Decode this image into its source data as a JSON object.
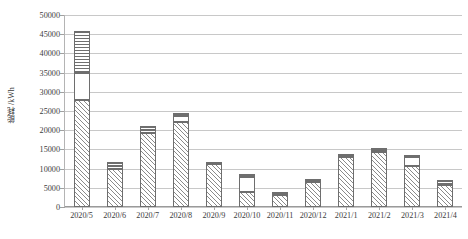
{
  "chart_data": {
    "type": "bar",
    "subtype": "stacked-bar",
    "title": "",
    "xlabel": "",
    "ylabel": "能耗 /kWh",
    "ylim": [
      0,
      50000
    ],
    "ytick_step": 5000,
    "yticks": [
      "0",
      "5000",
      "10000",
      "15000",
      "20000",
      "25000",
      "30000",
      "35000",
      "40000",
      "45000",
      "50000"
    ],
    "grid": true,
    "legend": "none",
    "categories": [
      "2020/5",
      "2020/6",
      "2020/7",
      "2020/8",
      "2020/9",
      "2020/10",
      "2020/11",
      "2020/12",
      "2021/1",
      "2021/2",
      "2021/3",
      "2021/4"
    ],
    "series": [
      {
        "name": "series-1",
        "pattern": "diagonal-hatch",
        "values": [
          27800,
          9900,
          19400,
          22200,
          11100,
          4000,
          3100,
          6600,
          13100,
          14300,
          10600,
          5800
        ]
      },
      {
        "name": "series-2",
        "pattern": "dots",
        "values": [
          7000,
          900,
          600,
          1500,
          100,
          3700,
          100,
          100,
          100,
          200,
          2300,
          100
        ]
      },
      {
        "name": "series-3",
        "pattern": "horizontal-lines",
        "values": [
          11000,
          1000,
          1000,
          800,
          600,
          900,
          600,
          600,
          600,
          800,
          600,
          1100
        ]
      }
    ],
    "totals": [
      45800,
      11800,
      21000,
      24500,
      11800,
      8600,
      3800,
      7300,
      13800,
      15300,
      13500,
      7000
    ]
  },
  "axis": {
    "y_title": "能耗 /kWh"
  }
}
